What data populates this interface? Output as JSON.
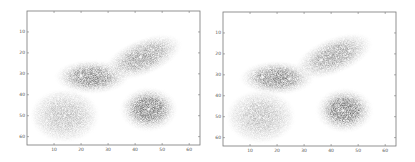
{
  "chart_data": [
    {
      "type": "heatmap",
      "title": "",
      "xlabel": "",
      "ylabel": "",
      "xlim": [
        0,
        64
      ],
      "ylim": [
        64,
        0
      ],
      "y_axis_inverted": true,
      "grid": false,
      "x_ticks": [
        10,
        20,
        30,
        40,
        50,
        60
      ],
      "y_ticks": [
        10,
        20,
        30,
        40,
        50,
        60
      ],
      "colormap": "gray_r",
      "blobs": [
        {
          "shape": "ellipse",
          "cx": 24,
          "cy": 31.5,
          "rx": 10,
          "ry": 4.5,
          "angle": 0,
          "darkness": 0.85
        },
        {
          "shape": "ellipse",
          "cx": 43,
          "cy": 22,
          "rx": 11,
          "ry": 4.8,
          "angle": -22,
          "darkness": 0.7
        },
        {
          "shape": "circle",
          "cx": 14,
          "cy": 50,
          "r": 9,
          "darkness": 0.5
        },
        {
          "shape": "circle",
          "cx": 45,
          "cy": 47,
          "r": 7.5,
          "darkness": 0.95
        }
      ],
      "markers": [
        {
          "x": 20,
          "y": 31
        },
        {
          "x": 42,
          "y": 22
        },
        {
          "x": 14,
          "y": 50
        },
        {
          "x": 45,
          "y": 47
        }
      ]
    },
    {
      "type": "heatmap",
      "title": "",
      "xlabel": "",
      "ylabel": "",
      "xlim": [
        0,
        64
      ],
      "ylim": [
        64,
        0
      ],
      "y_axis_inverted": true,
      "grid": false,
      "x_ticks": [
        10,
        20,
        30,
        40,
        50,
        60
      ],
      "y_ticks": [
        10,
        20,
        30,
        40,
        50,
        60
      ],
      "colormap": "gray_r",
      "blobs": [
        {
          "shape": "ellipse",
          "cx": 20,
          "cy": 31.5,
          "rx": 10,
          "ry": 4.5,
          "angle": 0,
          "darkness": 0.85
        },
        {
          "shape": "ellipse",
          "cx": 41,
          "cy": 21,
          "rx": 11,
          "ry": 4.8,
          "angle": -22,
          "darkness": 0.7
        },
        {
          "shape": "circle",
          "cx": 14,
          "cy": 50,
          "r": 9,
          "darkness": 0.5
        },
        {
          "shape": "circle",
          "cx": 45,
          "cy": 47,
          "r": 7.5,
          "darkness": 0.95
        }
      ],
      "markers": [
        {
          "x": 14.7,
          "y": 31
        },
        {
          "x": 24.6,
          "y": 32
        },
        {
          "x": 36.4,
          "y": 23
        },
        {
          "x": 46.7,
          "y": 18.6
        },
        {
          "x": 13.6,
          "y": 50.5
        },
        {
          "x": 44.5,
          "y": 47
        }
      ]
    }
  ],
  "panels": [
    {
      "id": "left",
      "left": 27,
      "top": 11,
      "width": 173,
      "height": 134
    },
    {
      "id": "right",
      "left": 223,
      "top": 12,
      "width": 173,
      "height": 134
    }
  ]
}
